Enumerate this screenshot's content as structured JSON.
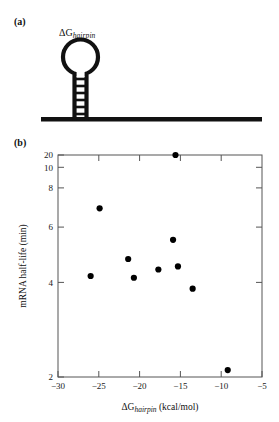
{
  "figure": {
    "panels": [
      {
        "id": "a",
        "label": "(a)"
      },
      {
        "id": "b",
        "label": "(b)"
      }
    ]
  },
  "panel_a": {
    "label": "(a)",
    "diagram_name": "rna-hairpin-diagram",
    "annotation": {
      "base": "ΔG",
      "subscript": "hairpin"
    },
    "stem_rungs": 6
  },
  "panel_b": {
    "label": "(b)"
  },
  "chart_data": {
    "type": "scatter",
    "title": "",
    "xlabel_base": "ΔG",
    "xlabel_subscript": "hairpin",
    "xlabel_units": " (kcal/mol)",
    "ylabel": "mRNA half-life (min)",
    "xscale": "linear",
    "yscale": "log",
    "xlim": [
      -30,
      -5
    ],
    "ylim": [
      2,
      20
    ],
    "xticks": [
      -30,
      -25,
      -20,
      -15,
      -10,
      -5
    ],
    "xticklabels": [
      "−30",
      "−25",
      "−20",
      "−15",
      "−10",
      "−5"
    ],
    "yticks": [
      2,
      4,
      6,
      8,
      10,
      20
    ],
    "yticklabels": [
      "2",
      "4",
      "6",
      "8",
      "10",
      "20"
    ],
    "grid": false,
    "legend": false,
    "marker": "circle",
    "marker_color": "#000000",
    "x": [
      -26.0,
      -24.9,
      -21.4,
      -20.7,
      -17.7,
      -15.9,
      -15.6,
      -15.3,
      -13.5,
      -9.2
    ],
    "y": [
      5.7,
      11.5,
      6.8,
      5.6,
      6.1,
      8.3,
      20.0,
      6.3,
      5.0,
      2.15
    ],
    "points": [
      {
        "x": -26.0,
        "y": 5.7
      },
      {
        "x": -24.9,
        "y": 11.5
      },
      {
        "x": -21.4,
        "y": 6.8
      },
      {
        "x": -20.7,
        "y": 5.6
      },
      {
        "x": -17.7,
        "y": 6.1
      },
      {
        "x": -15.9,
        "y": 8.3
      },
      {
        "x": -15.6,
        "y": 20.0
      },
      {
        "x": -15.3,
        "y": 6.3
      },
      {
        "x": -13.5,
        "y": 5.0
      },
      {
        "x": -9.2,
        "y": 2.15
      }
    ]
  }
}
